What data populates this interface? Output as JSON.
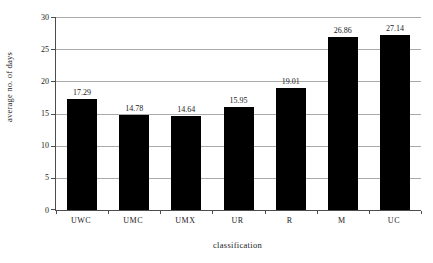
{
  "chart_data": {
    "type": "bar",
    "title": "",
    "categories": [
      "UWC",
      "UMC",
      "UMX",
      "UR",
      "R",
      "M",
      "UC"
    ],
    "values": [
      17.29,
      14.78,
      14.64,
      15.95,
      19.01,
      26.86,
      27.14
    ],
    "value_labels": [
      "17.29",
      "14.78",
      "14.64",
      "15.95",
      "19.01",
      "26.86",
      "27.14"
    ],
    "xlabel": "classification",
    "ylabel": "average no. of days",
    "ylim": [
      0,
      30
    ],
    "yticks": [
      0,
      5,
      10,
      15,
      20,
      25,
      30
    ],
    "legend": "none",
    "grid": "horizontal-only",
    "bar_color": "#000000",
    "gridline_color": "#a9a9a9",
    "axis_color": "#4d4d4d",
    "text_color": "#1a1a1a",
    "background_color": "#ffffff"
  }
}
